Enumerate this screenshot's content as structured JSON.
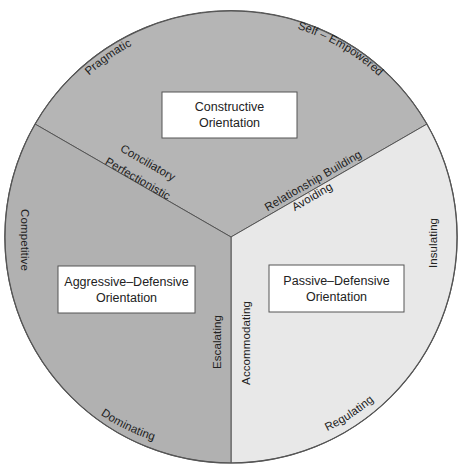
{
  "colors": {
    "constructive": "#b5b5b5",
    "aggressive_defensive": "#b1b1b1",
    "passive_defensive": "#e8e8e8",
    "outline": "#555555",
    "box_fill": "#ffffff",
    "text": "#222222"
  },
  "sectors": [
    {
      "id": "constructive",
      "title_line1": "Constructive",
      "title_line2": "Orientation",
      "styles": [
        "Pragmatic",
        "Self – Empowered",
        "Relationship Building",
        "Conciliatory"
      ]
    },
    {
      "id": "aggressive_defensive",
      "title_line1": "Aggressive–Defensive",
      "title_line2": "Orientation",
      "styles": [
        "Perfectionistic",
        "Competitive",
        "Dominating",
        "Escalating"
      ]
    },
    {
      "id": "passive_defensive",
      "title_line1": "Passive–Defensive",
      "title_line2": "Orientation",
      "styles": [
        "Avoiding",
        "Insulating",
        "Regulating",
        "Accommodating"
      ]
    }
  ]
}
